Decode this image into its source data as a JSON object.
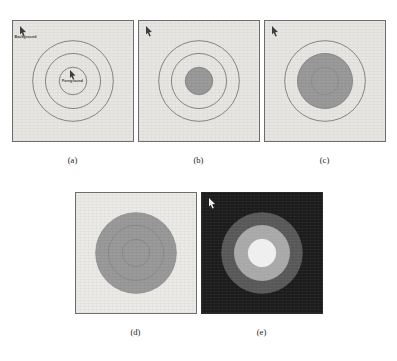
{
  "figure": {
    "panel_size_px": 122,
    "background_light": "#e7e6e2",
    "background_dark": "#1b1b1b",
    "outline_color": "#6b6b6b",
    "fill_gray": "#9a9a9a"
  },
  "annotations": {
    "background_label": "Background",
    "foreground_label": "Foreground",
    "marker_icon": "arrow-pointer-icon"
  },
  "panels": [
    {
      "id": "a",
      "caption": "(a)",
      "theme": "light",
      "background": "#e7e6e2",
      "marker": true,
      "labels": {
        "background": "Background",
        "foreground": "Foreground"
      },
      "rings": [
        {
          "name": "outer",
          "radius": 41,
          "fill": "none",
          "stroke": "#6b6b6b"
        },
        {
          "name": "middle",
          "radius": 28,
          "fill": "none",
          "stroke": "#6b6b6b"
        },
        {
          "name": "inner",
          "radius": 14,
          "fill": "none",
          "stroke": "#6b6b6b"
        }
      ]
    },
    {
      "id": "b",
      "caption": "(b)",
      "theme": "light",
      "background": "#e7e6e2",
      "marker": true,
      "labels": {},
      "rings": [
        {
          "name": "outer",
          "radius": 41,
          "fill": "none",
          "stroke": "#6b6b6b"
        },
        {
          "name": "middle",
          "radius": 28,
          "fill": "none",
          "stroke": "#6b6b6b"
        },
        {
          "name": "inner",
          "radius": 14,
          "fill": "#9a9a9a",
          "stroke": "#7d7d7d"
        }
      ]
    },
    {
      "id": "c",
      "caption": "(c)",
      "theme": "light",
      "background": "#e7e6e2",
      "marker": true,
      "labels": {},
      "rings": [
        {
          "name": "outer",
          "radius": 41,
          "fill": "none",
          "stroke": "#6b6b6b"
        },
        {
          "name": "middle",
          "radius": 28,
          "fill": "#9a9a9a",
          "stroke": "#7d7d7d"
        },
        {
          "name": "inner",
          "radius": 14,
          "fill": "#9a9a9a",
          "stroke": "#8a8a8a"
        }
      ]
    },
    {
      "id": "d",
      "caption": "(d)",
      "theme": "light",
      "background": "#eceae6",
      "marker": false,
      "labels": {},
      "rings": [
        {
          "name": "outer",
          "radius": 41,
          "fill": "#9a9a9a",
          "stroke": "#8c8c8c"
        },
        {
          "name": "middle",
          "radius": 28,
          "fill": "#9a9a9a",
          "stroke": "#868686"
        },
        {
          "name": "inner",
          "radius": 14,
          "fill": "#9a9a9a",
          "stroke": "#868686"
        }
      ]
    },
    {
      "id": "e",
      "caption": "(e)",
      "theme": "dark",
      "background": "#1b1b1b",
      "marker": true,
      "labels": {},
      "rings": [
        {
          "name": "outer",
          "radius": 41,
          "fill": "#575757",
          "stroke": "#5c5c5c"
        },
        {
          "name": "middle",
          "radius": 28,
          "fill": "#a8a8a8",
          "stroke": "#aeaeae"
        },
        {
          "name": "inner",
          "radius": 14,
          "fill": "#efefef",
          "stroke": "#f2f2f2"
        }
      ]
    }
  ]
}
